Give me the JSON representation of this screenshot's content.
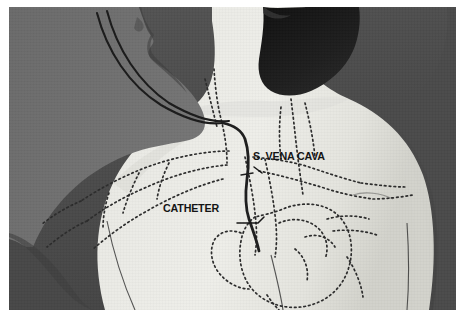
{
  "figure": {
    "kind": "medical-illustration",
    "rendering": "grayscale halftone photograph with dotted overlay of venous anatomy",
    "border_color": "#ffffff",
    "background_color": "#4d4d4d",
    "skin_color": "#e8e8e4",
    "hair_color": "#1c1c1c",
    "silhouette_color": "#6e6e6e",
    "ink_color": "#141414"
  },
  "annotations": [
    {
      "id": "s-vena-cava",
      "text": "S. VENA CAVA",
      "leader": "short diagonal line pointing up-left to the superior vena cava"
    },
    {
      "id": "catheter",
      "text": "CATHETER",
      "leader": "horizontal line pointing right to the catheter tube in the neck"
    }
  ],
  "anatomy": {
    "structures": [
      "head in right profile with dark hair",
      "neck",
      "left and right shoulders",
      "upper back with scapulae",
      "superior vena cava",
      "heart",
      "subclavian and axillary veins (dotted)",
      "jugular veins (dotted)"
    ],
    "device": {
      "name": "central venous catheter",
      "path": "enters at the neck, descends through the superior vena cava, tip at the heart",
      "external_tubing": "two parallel lines curving away to the upper left"
    }
  }
}
